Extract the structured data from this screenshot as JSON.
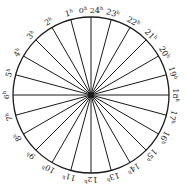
{
  "diagram": {
    "type": "24-hour dial",
    "center": [
      91,
      95
    ],
    "radius": 78,
    "stroke_color": "#1a1a1a",
    "spokes": 24,
    "labels": [
      {
        "hour": 0,
        "text": "0h 24h"
      },
      {
        "hour": 1,
        "text": "1h"
      },
      {
        "hour": 2,
        "text": "2h"
      },
      {
        "hour": 3,
        "text": "3h"
      },
      {
        "hour": 4,
        "text": "4h"
      },
      {
        "hour": 5,
        "text": "5h"
      },
      {
        "hour": 6,
        "text": "6h"
      },
      {
        "hour": 7,
        "text": "7h"
      },
      {
        "hour": 8,
        "text": "8h"
      },
      {
        "hour": 9,
        "text": "9h"
      },
      {
        "hour": 10,
        "text": "10h"
      },
      {
        "hour": 11,
        "text": "11h"
      },
      {
        "hour": 12,
        "text": "12h"
      },
      {
        "hour": 13,
        "text": "13h"
      },
      {
        "hour": 14,
        "text": "14h"
      },
      {
        "hour": 15,
        "text": "15h"
      },
      {
        "hour": 16,
        "text": "16h"
      },
      {
        "hour": 17,
        "text": "17h"
      },
      {
        "hour": 18,
        "text": "18h"
      },
      {
        "hour": 19,
        "text": "19h"
      },
      {
        "hour": 20,
        "text": "20h"
      },
      {
        "hour": 21,
        "text": "21h"
      },
      {
        "hour": 22,
        "text": "22h"
      },
      {
        "hour": 23,
        "text": "23h"
      }
    ],
    "direction": "counter-clockwise (hours increase to the left from top)"
  }
}
